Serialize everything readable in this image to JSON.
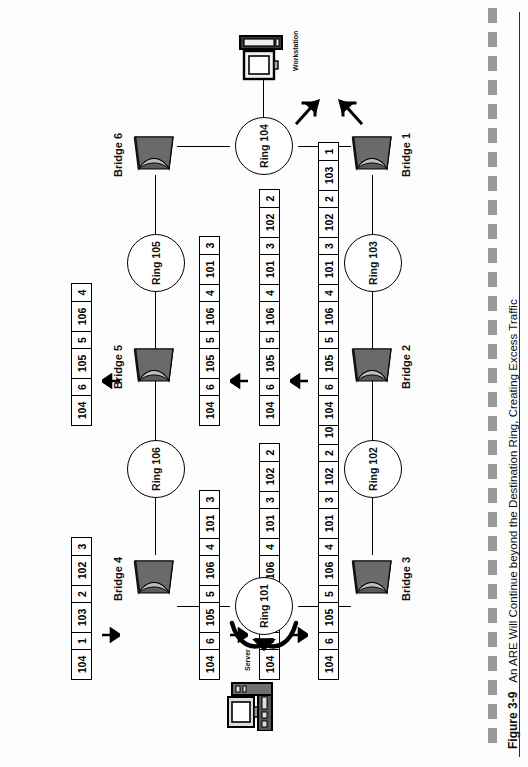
{
  "figure": {
    "number": "Figure 3-9",
    "caption": "An ARE Will Continue beyond the Destination Ring, Creating Excess Traffic"
  },
  "devices": {
    "server": {
      "label": "Server",
      "icon": "computer-icon"
    },
    "workstation": {
      "label": "Workstation",
      "icon": "computer-icon"
    }
  },
  "rings": [
    {
      "id": "ring-101",
      "label": "Ring 101"
    },
    {
      "id": "ring-102",
      "label": "Ring 102"
    },
    {
      "id": "ring-103",
      "label": "Ring 103"
    },
    {
      "id": "ring-104",
      "label": "Ring 104"
    },
    {
      "id": "ring-105",
      "label": "Ring 105"
    },
    {
      "id": "ring-106",
      "label": "Ring 106"
    }
  ],
  "bridges": [
    {
      "id": "bridge-1",
      "label": "Bridge 1"
    },
    {
      "id": "bridge-2",
      "label": "Bridge 2"
    },
    {
      "id": "bridge-3",
      "label": "Bridge 3"
    },
    {
      "id": "bridge-4",
      "label": "Bridge 4"
    },
    {
      "id": "bridge-5",
      "label": "Bridge 5"
    },
    {
      "id": "bridge-6",
      "label": "Bridge 6"
    }
  ],
  "frames": [
    {
      "id": "frame-b4-out",
      "name": "frame-bridge4-out",
      "cells": [
        "104",
        "1",
        "103",
        "2",
        "102",
        "3"
      ],
      "widths": [
        "wide",
        "narrow",
        "wide",
        "narrow",
        "wide",
        "narrow"
      ]
    },
    {
      "id": "frame-b4-in",
      "name": "frame-bridge4-in",
      "cells": [
        "104",
        "6",
        "105",
        "5",
        "106",
        "4",
        "101",
        "3"
      ],
      "widths": [
        "wide",
        "narrow",
        "wide",
        "narrow",
        "wide",
        "narrow",
        "wide",
        "narrow"
      ]
    },
    {
      "id": "frame-b5-in",
      "name": "frame-bridge5-in",
      "cells": [
        "104",
        "6",
        "105",
        "5",
        "106",
        "4",
        "101",
        "3",
        "102",
        "2"
      ],
      "widths": [
        "wide",
        "narrow",
        "wide",
        "narrow",
        "wide",
        "narrow",
        "wide",
        "narrow",
        "wide",
        "narrow"
      ]
    },
    {
      "id": "frame-b6-in",
      "name": "frame-bridge6-in",
      "cells": [
        "104",
        "6",
        "105",
        "5",
        "106",
        "4",
        "101",
        "3",
        "102",
        "2",
        "103",
        "1"
      ],
      "widths": [
        "wide",
        "narrow",
        "wide",
        "narrow",
        "wide",
        "narrow",
        "wide",
        "narrow",
        "wide",
        "narrow",
        "wide",
        "narrow"
      ]
    },
    {
      "id": "frame-b3-out",
      "name": "frame-bridge3-out",
      "cells": [
        "104",
        "6",
        "105",
        "5",
        "106",
        "4"
      ],
      "widths": [
        "wide",
        "narrow",
        "wide",
        "narrow",
        "wide",
        "narrow"
      ]
    },
    {
      "id": "frame-b3-in",
      "name": "frame-bridge3-in",
      "cells": [
        "104",
        "6",
        "105",
        "5",
        "106",
        "4",
        "101",
        "3"
      ],
      "widths": [
        "wide",
        "narrow",
        "wide",
        "narrow",
        "wide",
        "narrow",
        "wide",
        "narrow"
      ]
    },
    {
      "id": "frame-b2-in",
      "name": "frame-bridge2-in",
      "cells": [
        "104",
        "6",
        "105",
        "5",
        "106",
        "4",
        "101",
        "3",
        "102",
        "2"
      ],
      "widths": [
        "wide",
        "narrow",
        "wide",
        "narrow",
        "wide",
        "narrow",
        "wide",
        "narrow",
        "wide",
        "narrow"
      ]
    },
    {
      "id": "frame-b1-in",
      "name": "frame-bridge1-in",
      "cells": [
        "104",
        "6",
        "105",
        "5",
        "106",
        "4",
        "101",
        "3",
        "102",
        "2",
        "103",
        "1"
      ],
      "widths": [
        "wide",
        "narrow",
        "wide",
        "narrow",
        "wide",
        "narrow",
        "wide",
        "narrow",
        "wide",
        "narrow",
        "wide",
        "narrow"
      ]
    }
  ]
}
